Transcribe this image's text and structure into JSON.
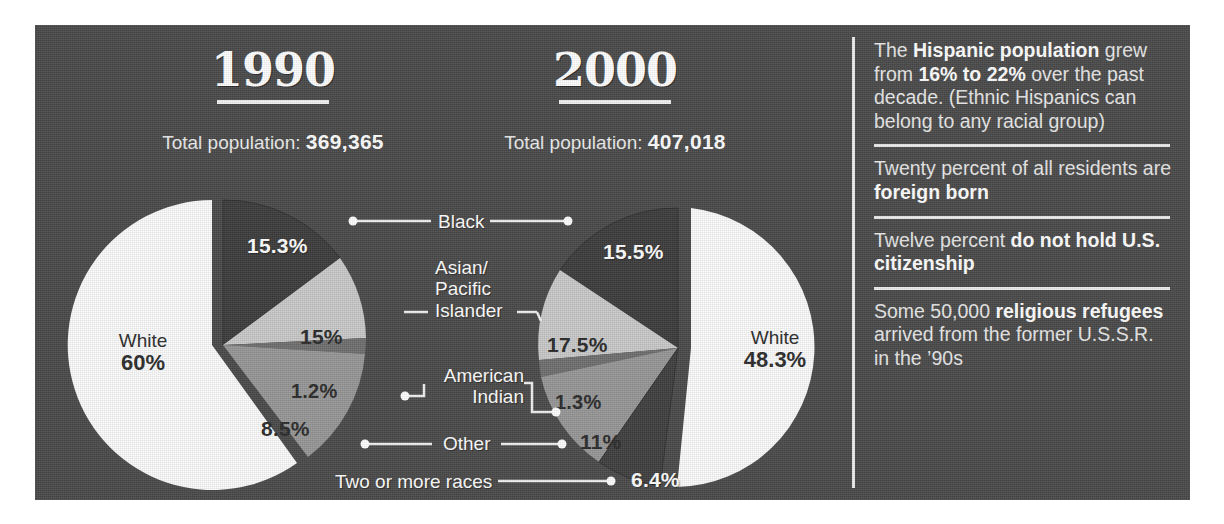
{
  "chart_data": [
    {
      "type": "pie",
      "title": "1990",
      "subtitle_prefix": "Total population:",
      "total_population": "369,365",
      "categories": [
        "White",
        "Black",
        "Asian/Pacific Islander",
        "American Indian",
        "Other"
      ],
      "values": [
        60,
        15.3,
        15,
        1.2,
        8.5
      ],
      "labels": [
        "60%",
        "15.3%",
        "15%",
        "1.2%",
        "8.5%"
      ],
      "white_label": "White",
      "white_value": "60%"
    },
    {
      "type": "pie",
      "title": "2000",
      "subtitle_prefix": "Total population:",
      "total_population": "407,018",
      "categories": [
        "White",
        "Black",
        "Asian/Pacific Islander",
        "American Indian",
        "Other",
        "Two or more races"
      ],
      "values": [
        48.3,
        15.5,
        17.5,
        1.3,
        11,
        6.4
      ],
      "labels": [
        "48.3%",
        "15.5%",
        "17.5%",
        "1.3%",
        "11%",
        "6.4%"
      ],
      "white_label": "White",
      "white_value": "48.3%"
    }
  ],
  "legend": {
    "black": "Black",
    "asian_line1": "Asian/",
    "asian_line2": "Pacific",
    "asian_line3": "Islander",
    "amerind_line1": "American",
    "amerind_line2": "Indian",
    "other": "Other",
    "two_or_more": "Two or more races"
  },
  "facts": [
    {
      "id": "hispanic-population",
      "parts": [
        {
          "t": "The ",
          "b": false
        },
        {
          "t": "Hispanic population",
          "b": true
        },
        {
          "t": " grew from ",
          "b": false
        },
        {
          "t": "16% to 22%",
          "b": true
        },
        {
          "t": " over the past decade. (Ethnic Hispanics can belong to any racial group)",
          "b": false
        }
      ]
    },
    {
      "id": "foreign-born",
      "parts": [
        {
          "t": "Twenty percent of all residents are ",
          "b": false
        },
        {
          "t": "foreign born",
          "b": true
        }
      ]
    },
    {
      "id": "citizenship",
      "parts": [
        {
          "t": "Twelve percent ",
          "b": false
        },
        {
          "t": "do not hold U.S. citizenship",
          "b": true
        }
      ]
    },
    {
      "id": "religious-refugees",
      "parts": [
        {
          "t": "Some 50,000 ",
          "b": false
        },
        {
          "t": "religious refugees",
          "b": true
        },
        {
          "t": " arrived from the former U.S.S.R. in the ’90s",
          "b": false
        }
      ]
    }
  ],
  "colors": {
    "panel_background": "#4a4a4a",
    "white_slice": "#fbfbfb",
    "light_gray_slice": "#c9c9c9",
    "mid_gray_slice": "#969696",
    "dark_slice": "#3c3c3c",
    "rule": "#ededed",
    "text": "#ffffff"
  }
}
